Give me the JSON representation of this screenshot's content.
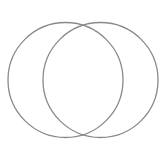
{
  "image": {
    "subject": "two-overlapping-wire-rings",
    "background_color": "#ffffff",
    "stroke_color": "#8a8a86",
    "rings": [
      {
        "cx": 65.5,
        "cy": 80,
        "r": 57.5
      },
      {
        "cx": 100.5,
        "cy": 80,
        "r": 57.5
      }
    ]
  }
}
